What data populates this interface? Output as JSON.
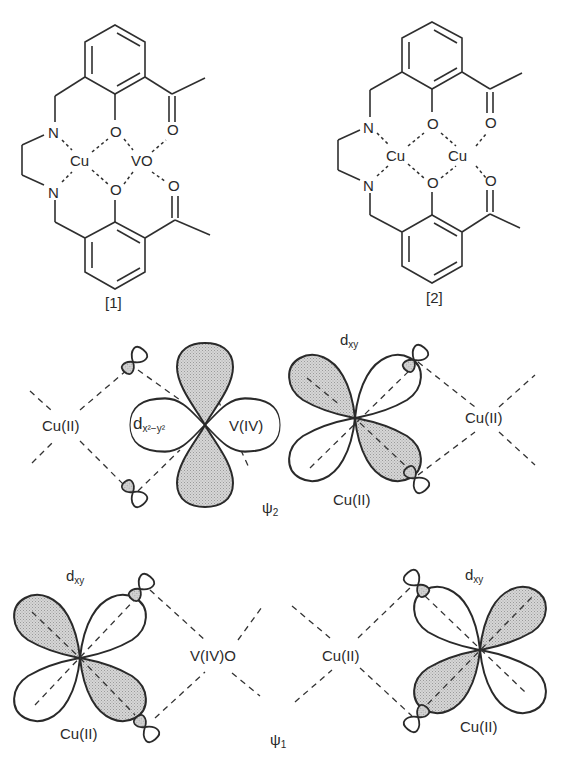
{
  "figure": {
    "structures": [
      {
        "label": "[1]",
        "atoms": {
          "n_top": "N",
          "n_bottom": "N",
          "metal_left": "Cu",
          "metal_right": "VO",
          "o_phenol_top": "O",
          "o_phenol_bottom": "O",
          "o_acetyl_top": "O",
          "o_acetyl_bottom": "O"
        }
      },
      {
        "label": "[2]",
        "atoms": {
          "n_top": "N",
          "n_bottom": "N",
          "metal_left": "Cu",
          "metal_right": "Cu",
          "o_phenol_top": "O",
          "o_phenol_bottom": "O",
          "o_acetyl_top": "O",
          "o_acetyl_bottom": "O"
        }
      }
    ],
    "psi2": {
      "label_symbol": "ψ",
      "label_sub": "2",
      "left_center": "Cu(II)",
      "v_orbital": {
        "d": "d",
        "sub": "x²−y²",
        "metal": "V(IV)"
      },
      "cu_orbital": {
        "d": "d",
        "sub": "xy",
        "metal": "Cu(II)"
      },
      "right_center": "Cu(II)"
    },
    "psi1": {
      "label_symbol": "ψ",
      "label_sub": "1",
      "left_orbital": {
        "d": "d",
        "sub": "xy",
        "metal": "Cu(II)"
      },
      "middle_center_left": "V(IV)O",
      "middle_center_right": "Cu(II)",
      "right_orbital": {
        "d": "d",
        "sub": "xy",
        "metal": "Cu(II)"
      }
    },
    "colors": {
      "line": "#2a2a2a",
      "shade": "#c9c9c9",
      "background": "#ffffff"
    }
  }
}
